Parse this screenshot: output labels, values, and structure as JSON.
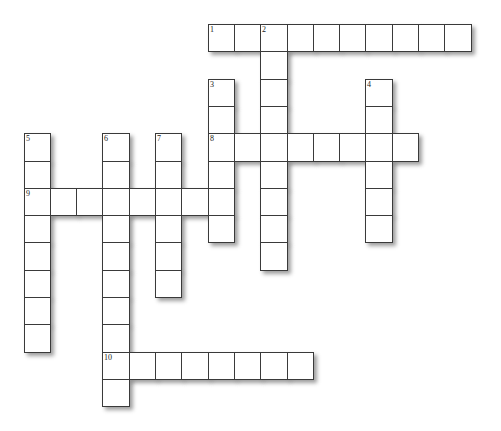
{
  "puzzle": {
    "type": "crossword",
    "grid": {
      "origin_x": 23.5,
      "origin_y": 24,
      "cell_width": 26.3,
      "cell_height": 27.3,
      "border_color": "#3a3a3a",
      "cell_fill": "#ffffff",
      "background": "#ffffff"
    },
    "entries": [
      {
        "number": "1",
        "direction": "across",
        "col": 7,
        "row": 0,
        "length": 10
      },
      {
        "number": "2",
        "direction": "down",
        "col": 9,
        "row": 0,
        "length": 9
      },
      {
        "number": "3",
        "direction": "down",
        "col": 7,
        "row": 2,
        "length": 6
      },
      {
        "number": "4",
        "direction": "down",
        "col": 13,
        "row": 2,
        "length": 6
      },
      {
        "number": "5",
        "direction": "down",
        "col": 0,
        "row": 4,
        "length": 8
      },
      {
        "number": "6",
        "direction": "down",
        "col": 3,
        "row": 4,
        "length": 10
      },
      {
        "number": "7",
        "direction": "down",
        "col": 5,
        "row": 4,
        "length": 6
      },
      {
        "number": "8",
        "direction": "across",
        "col": 7,
        "row": 4,
        "length": 8
      },
      {
        "number": "9",
        "direction": "across",
        "col": 0,
        "row": 6,
        "length": 8
      },
      {
        "number": "10",
        "direction": "across",
        "col": 3,
        "row": 12,
        "length": 8
      }
    ]
  }
}
